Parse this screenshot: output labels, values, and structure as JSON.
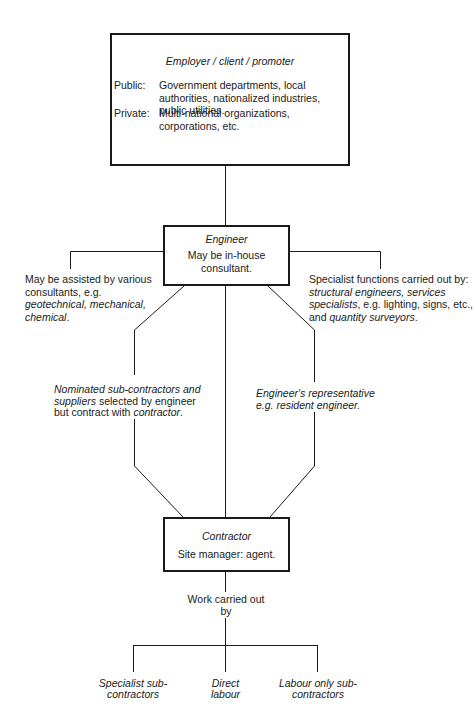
{
  "employer": {
    "title": "Employer / client / promoter",
    "rows": [
      {
        "label": "Public:",
        "value": "Government departments, local authorities, nationalized industries, public utilities."
      },
      {
        "label": "Private:",
        "value": "Multi-national organizations, corporations, etc."
      }
    ]
  },
  "engineer": {
    "title": "Engineer",
    "subtitle": "May be in-house consultant."
  },
  "left_note": {
    "p1": "May be assisted by various consultants, e.g. ",
    "p2": "geotechnical, mechanical, chemical",
    "p3": "."
  },
  "right_note": {
    "p1": "Specialist functions carried out by: ",
    "p2": "structural engineers, services specialists",
    "p3": ", e.g. lighting, signs, etc., and ",
    "p4": "quantity surveyors",
    "p5": "."
  },
  "nominated_note": {
    "p1": "Nominated sub-contractors and suppliers",
    "p2": " selected by engineer but contract with ",
    "p3": "contractor",
    "p4": "."
  },
  "rep_note": "Engineer's representative e.g. resident engineer.",
  "contractor": {
    "title": "Contractor",
    "subtitle": "Site manager: agent."
  },
  "work_label": "Work carried out by",
  "work_types": [
    {
      "label": "Specialist sub-contractors"
    },
    {
      "label": "Direct labour"
    },
    {
      "label": "Labour only sub-contractors"
    }
  ]
}
